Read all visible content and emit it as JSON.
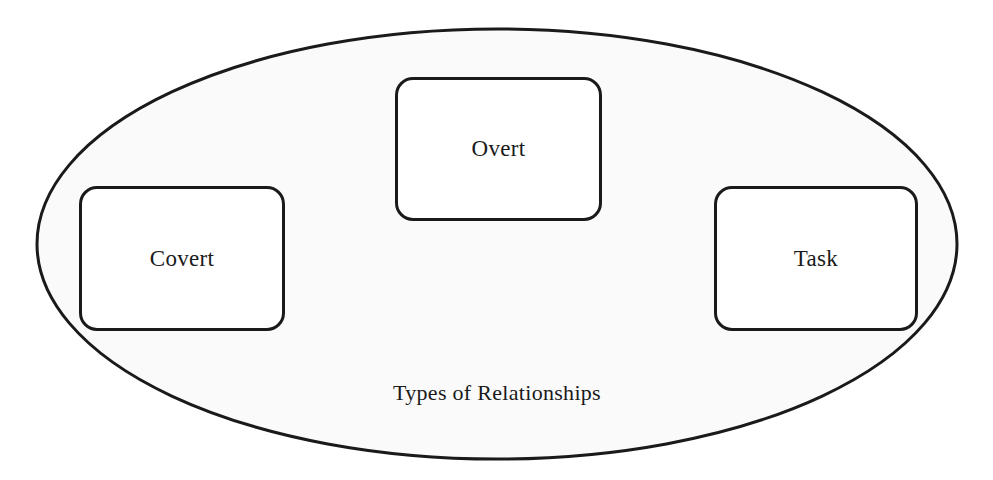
{
  "diagram": {
    "container": {
      "label": "Types of Relationships",
      "shape": "ellipse",
      "stroke": "#1a1a1a",
      "fill": "#fafafa"
    },
    "nodes": [
      {
        "id": "overt",
        "label": "Overt"
      },
      {
        "id": "covert",
        "label": "Covert"
      },
      {
        "id": "task",
        "label": "Task"
      }
    ]
  }
}
